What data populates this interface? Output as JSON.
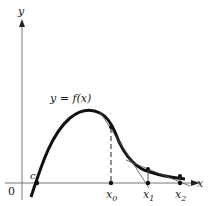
{
  "diagram": {
    "axes": {
      "x_label": "x",
      "y_label": "y",
      "origin_label": "0"
    },
    "curve_label": "y = f(x)",
    "root_label": "c",
    "points": [
      {
        "label": "x",
        "subscript": "0"
      },
      {
        "label": "x",
        "subscript": "1"
      },
      {
        "label": "x",
        "subscript": "2"
      }
    ],
    "colors": {
      "curve": "#111111",
      "axis": "#777777",
      "tangent": "#555555"
    }
  }
}
